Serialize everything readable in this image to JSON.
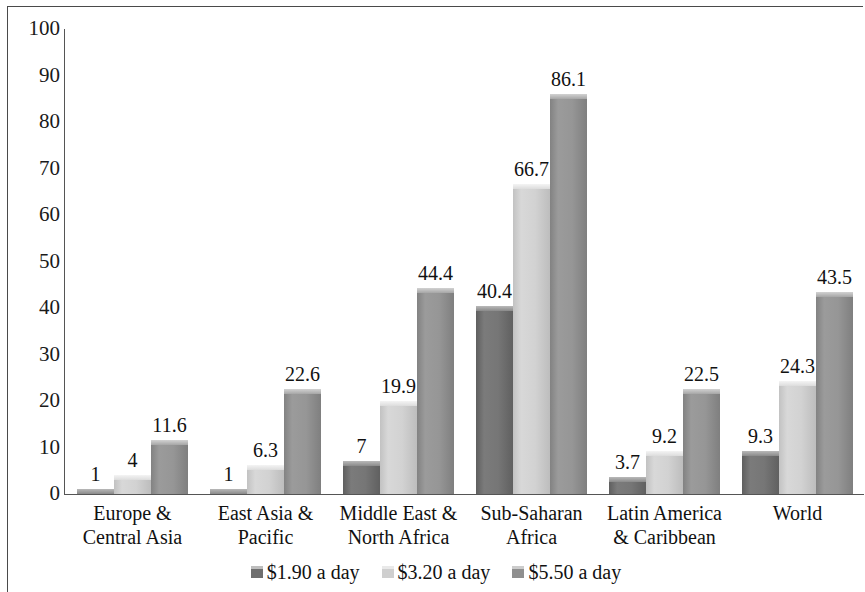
{
  "chart_data": {
    "type": "bar",
    "title": "",
    "xlabel": "",
    "ylabel": "",
    "ylim": [
      0,
      100
    ],
    "yticks": [
      100,
      90,
      80,
      70,
      60,
      50,
      40,
      30,
      20,
      10,
      0
    ],
    "grid": false,
    "legend_position": "bottom",
    "categories": [
      "Europe &\nCentral Asia",
      "East Asia &\nPacific",
      "Middle East &\nNorth Africa",
      "Sub-Saharan\nAfrica",
      "Latin America\n& Caribbean",
      "World"
    ],
    "category_lines": [
      [
        "Europe &",
        "Central Asia"
      ],
      [
        "East Asia &",
        "Pacific"
      ],
      [
        "Middle East &",
        "North Africa"
      ],
      [
        "Sub-Saharan",
        "Africa"
      ],
      [
        "Latin America",
        "& Caribbean"
      ],
      [
        "World",
        ""
      ]
    ],
    "series": [
      {
        "name": "$1.90 a day",
        "color": "#6f6f6f",
        "values": [
          1,
          1,
          7,
          40.4,
          3.7,
          9.3
        ],
        "labels": [
          "1",
          "1",
          "7",
          "40.4",
          "3.7",
          "9.3"
        ]
      },
      {
        "name": "$3.20 a day",
        "color": "#cfcfcf",
        "values": [
          4,
          6.3,
          19.9,
          66.7,
          9.2,
          24.3
        ],
        "labels": [
          "4",
          "6.3",
          "19.9",
          "66.7",
          "9.2",
          "24.3"
        ]
      },
      {
        "name": "$5.50 a day",
        "color": "#8f8f8f",
        "values": [
          11.6,
          22.6,
          44.4,
          86.1,
          22.5,
          43.5
        ],
        "labels": [
          "11.6",
          "22.6",
          "44.4",
          "86.1",
          "22.5",
          "43.5"
        ]
      }
    ]
  }
}
